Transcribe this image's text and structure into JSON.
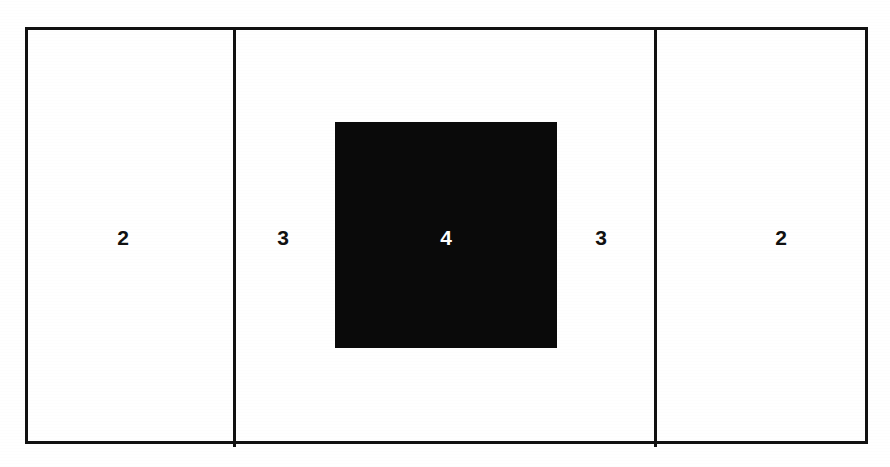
{
  "figure": {
    "type": "proportional-spacing-diagram",
    "background_color": "#ffffff",
    "line_color": "#111111",
    "fill_color": "#0a0a0a",
    "label_light_color": "#ffffff"
  },
  "frame": {
    "name": "outer-rectangle"
  },
  "dividers": [
    {
      "name": "divider-left"
    },
    {
      "name": "divider-right"
    }
  ],
  "shape": {
    "name": "black-square",
    "label": "4"
  },
  "labels": {
    "left_cell": "2",
    "left_gap": "3",
    "square": "4",
    "right_gap": "3",
    "right_cell": "2"
  },
  "chart_data": {
    "type": "bar",
    "title": "",
    "xlabel": "",
    "ylabel": "",
    "categories": [
      "left cell",
      "left gap",
      "square",
      "right gap",
      "right cell"
    ],
    "values": [
      2,
      3,
      4,
      3,
      2
    ],
    "grid": false,
    "legend": "none",
    "ylim": [
      0,
      4
    ]
  }
}
